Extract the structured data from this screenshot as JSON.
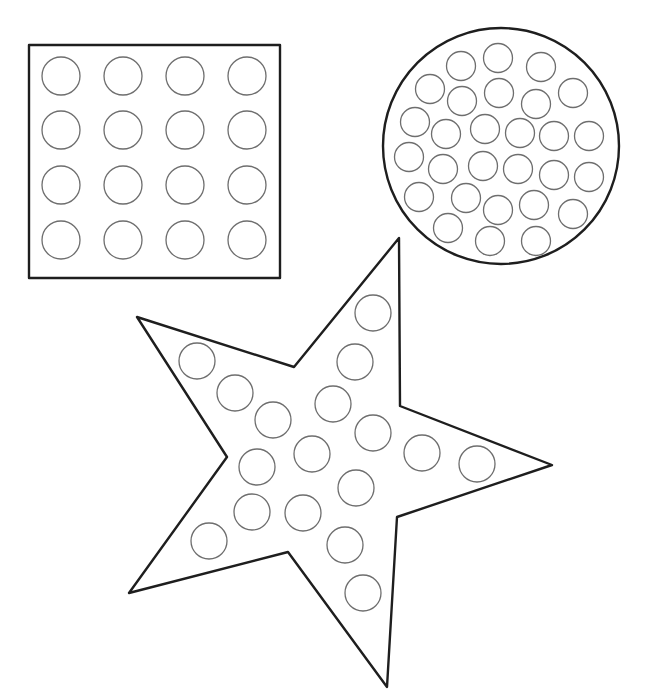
{
  "colors": {
    "background": "#ffffff",
    "outline": "#1e1e1e",
    "dot_stroke": "#6e6e6e"
  },
  "shapes": {
    "square": {
      "name": "square",
      "rect": {
        "x": 29,
        "y": 45,
        "width": 251,
        "height": 233
      },
      "dot_radius": 19,
      "dots": [
        [
          61,
          76
        ],
        [
          123,
          76
        ],
        [
          185,
          76
        ],
        [
          247,
          76
        ],
        [
          61,
          130
        ],
        [
          123,
          130
        ],
        [
          185,
          130
        ],
        [
          247,
          130
        ],
        [
          61,
          185
        ],
        [
          123,
          185
        ],
        [
          185,
          185
        ],
        [
          247,
          185
        ],
        [
          61,
          240
        ],
        [
          123,
          240
        ],
        [
          185,
          240
        ],
        [
          247,
          240
        ]
      ]
    },
    "circle": {
      "name": "circle",
      "outer": {
        "cx": 501,
        "cy": 146,
        "r": 118
      },
      "dot_radius": 14.5,
      "dots": [
        [
          461,
          66
        ],
        [
          498,
          58
        ],
        [
          541,
          67
        ],
        [
          430,
          89
        ],
        [
          462,
          101
        ],
        [
          499,
          93
        ],
        [
          536,
          104
        ],
        [
          573,
          93
        ],
        [
          415,
          122
        ],
        [
          446,
          134
        ],
        [
          485,
          129
        ],
        [
          520,
          133
        ],
        [
          554,
          136
        ],
        [
          589,
          136
        ],
        [
          409,
          157
        ],
        [
          443,
          169
        ],
        [
          483,
          166
        ],
        [
          518,
          169
        ],
        [
          554,
          175
        ],
        [
          589,
          177
        ],
        [
          419,
          197
        ],
        [
          466,
          198
        ],
        [
          498,
          210
        ],
        [
          534,
          205
        ],
        [
          573,
          214
        ],
        [
          448,
          228
        ],
        [
          490,
          241
        ],
        [
          536,
          241
        ]
      ]
    },
    "star": {
      "name": "star",
      "points": "399,238 400,406 552,465 397,517 387,687 288,552 129,593 227,457 137,317 294,367",
      "dot_radius": 18,
      "dots": [
        [
          373,
          313
        ],
        [
          355,
          362
        ],
        [
          197,
          361
        ],
        [
          235,
          393
        ],
        [
          273,
          420
        ],
        [
          333,
          404
        ],
        [
          373,
          433
        ],
        [
          312,
          454
        ],
        [
          257,
          467
        ],
        [
          422,
          453
        ],
        [
          477,
          464
        ],
        [
          356,
          488
        ],
        [
          252,
          512
        ],
        [
          303,
          513
        ],
        [
          209,
          541
        ],
        [
          345,
          545
        ],
        [
          363,
          593
        ]
      ]
    }
  }
}
